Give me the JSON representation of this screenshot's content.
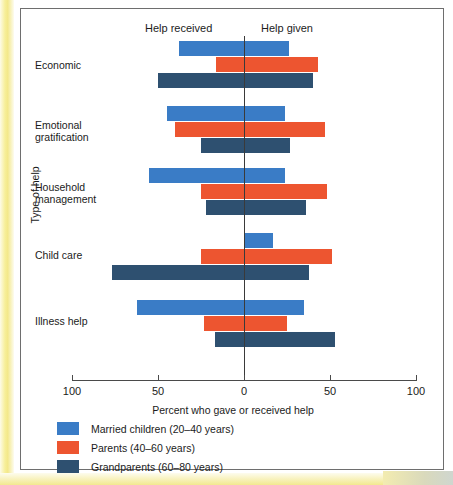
{
  "figure": {
    "left_header": "Help received",
    "right_header": "Help given"
  },
  "chart_data": {
    "type": "bar",
    "orientation": "horizontal",
    "title": "",
    "subtitle": "",
    "xlabel": "Percent who gave or received help",
    "ylabel": "Type of help",
    "xlim": [
      -100,
      100
    ],
    "xticks": [
      -100,
      -50,
      0,
      50,
      100
    ],
    "xtick_labels": [
      "100",
      "50",
      "0",
      "50",
      "100"
    ],
    "grid": false,
    "legend_position": "below",
    "axis_note_left": "Help received",
    "axis_note_right": "Help given",
    "categories": [
      "Economic",
      "Emotional gratification",
      "Household management",
      "Child care",
      "Illness help"
    ],
    "series": [
      {
        "name": "Married children (20–40 years)",
        "color": "#3A7CC6",
        "received": [
          38,
          45,
          55,
          0,
          62
        ],
        "given": [
          26,
          24,
          24,
          17,
          35
        ]
      },
      {
        "name": "Parents (40–60 years)",
        "color": "#ED5530",
        "received": [
          16,
          40,
          25,
          25,
          23
        ],
        "given": [
          43,
          47,
          48,
          51,
          25
        ]
      },
      {
        "name": "Grandparents (60–80 years)",
        "color": "#2E5070",
        "received": [
          50,
          25,
          22,
          77,
          17
        ],
        "given": [
          40,
          27,
          36,
          38,
          53
        ]
      }
    ]
  },
  "legend": {
    "entries": [
      {
        "label": "Married children (20–40 years)",
        "color": "#3A7CC6"
      },
      {
        "label": "Parents (40–60 years)",
        "color": "#ED5530"
      },
      {
        "label": "Grandparents (60–80 years)",
        "color": "#2E5070"
      }
    ]
  }
}
